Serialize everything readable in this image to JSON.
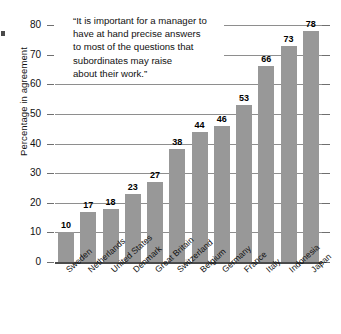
{
  "chart_data": {
    "type": "bar",
    "title": "",
    "annotation": "“It is important for a manager to have at hand precise answers to most of the questions that subordinates may raise about their work.”",
    "annotation_lines": [
      "“It is important for a manager to",
      "have at hand precise answers",
      "to most of the questions that",
      "subordinates may raise",
      "about their work.”"
    ],
    "xlabel": "",
    "ylabel": "Percentage in agreement",
    "ylim": [
      0,
      80
    ],
    "ytick_labels": [
      "0",
      "10",
      "20",
      "30",
      "40",
      "50",
      "60",
      "70",
      "80"
    ],
    "yticks": [
      0,
      10,
      20,
      30,
      40,
      50,
      60,
      70,
      80
    ],
    "grid": true,
    "legend": "none",
    "bar_color": "#989898",
    "grid_color": "#8e8e8e",
    "axis_color": "#4a4a4a",
    "categories": [
      "Sweden",
      "Netherlands",
      "United States",
      "Denmark",
      "Great Britain",
      "Switzerland",
      "Belgium",
      "Germany",
      "France",
      "Italy",
      "Indonesia",
      "Japan"
    ],
    "values": [
      10,
      17,
      18,
      23,
      27,
      38,
      44,
      46,
      53,
      66,
      73,
      78
    ],
    "value_labels": [
      "10",
      "17",
      "18",
      "23",
      "27",
      "38",
      "44",
      "46",
      "53",
      "66",
      "73",
      "78"
    ]
  }
}
